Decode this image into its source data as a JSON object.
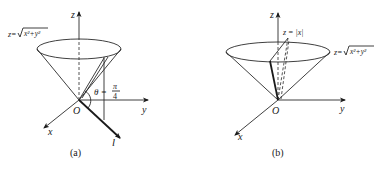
{
  "figure": {
    "panels": [
      {
        "id": "a",
        "caption": "(a)",
        "axis_labels": {
          "z": "z",
          "y": "y",
          "x": "x",
          "origin": "O"
        },
        "surface_label": "z=√(x²+y²)",
        "surface_label_prefix": "z=",
        "surface_label_radicand": "x²+y²",
        "angle_label": "θ =",
        "angle_num": "π",
        "angle_den": "4",
        "line_label": "l"
      },
      {
        "id": "b",
        "caption": "(b)",
        "axis_labels": {
          "z": "z",
          "y": "y",
          "x": "x",
          "origin": "O"
        },
        "surface_label": "z=√(x²+y²)",
        "surface_label_prefix": "z=",
        "surface_label_radicand": "x²+y²",
        "plane_label": "z = |x|"
      }
    ],
    "colors": {
      "ink": "#1a1a1a",
      "background": "#ffffff"
    }
  }
}
